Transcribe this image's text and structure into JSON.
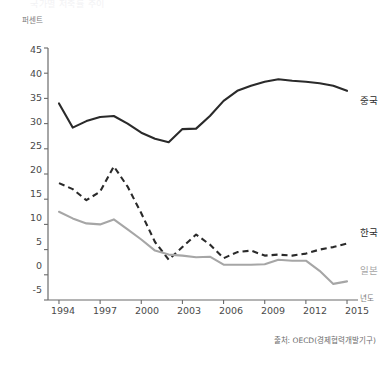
{
  "title": "국가별 저축률 추이",
  "axes": {
    "y_unit": "퍼센트",
    "x_unit": "년도",
    "y_ticks": [
      45,
      40,
      35,
      30,
      25,
      20,
      15,
      10,
      5,
      0,
      -5
    ],
    "x_ticks": [
      1994,
      1997,
      2000,
      2003,
      2006,
      2009,
      2012,
      2015
    ]
  },
  "labels": {
    "china": "중국",
    "korea": "한국",
    "japan": "일본"
  },
  "source": "출처: OECD(경제협력개발기구)",
  "colors": {
    "china": "#2a2a2a",
    "korea": "#2a2a2a",
    "japan": "#a6a6a6",
    "axis": "#6b6b6b"
  },
  "chart_data": {
    "type": "line",
    "title": "국가별 저축률 추이",
    "xlabel": "년도",
    "ylabel": "퍼센트",
    "xlim": [
      1993.2,
      2015.8
    ],
    "ylim": [
      -5,
      45
    ],
    "grid": false,
    "legend_position": "right-inline",
    "x": [
      1994,
      1995,
      1996,
      1997,
      1998,
      1999,
      2000,
      2001,
      2002,
      2003,
      2004,
      2005,
      2006,
      2007,
      2008,
      2009,
      2010,
      2011,
      2012,
      2013,
      2014,
      2015
    ],
    "series": [
      {
        "name": "중국",
        "style": "solid",
        "color": "#2a2a2a",
        "values": [
          34.0,
          29.2,
          30.5,
          31.3,
          31.5,
          30.0,
          28.2,
          27.0,
          26.3,
          28.9,
          29.0,
          31.5,
          34.5,
          36.5,
          37.5,
          38.3,
          38.8,
          38.5,
          38.3,
          38.0,
          37.5,
          36.5
        ]
      },
      {
        "name": "한국",
        "style": "dashed",
        "color": "#2a2a2a",
        "values": [
          18.2,
          17.0,
          14.8,
          16.5,
          21.5,
          17.5,
          12.2,
          6.5,
          3.0,
          5.5,
          8.0,
          6.0,
          3.3,
          4.5,
          4.8,
          3.8,
          4.0,
          3.8,
          4.2,
          5.0,
          5.5,
          6.2
        ]
      },
      {
        "name": "일본",
        "style": "solid",
        "color": "#a6a6a6",
        "values": [
          12.5,
          11.2,
          10.2,
          10.0,
          11.0,
          9.0,
          7.0,
          4.8,
          4.0,
          3.8,
          3.5,
          3.6,
          2.0,
          2.0,
          2.0,
          2.1,
          3.0,
          2.8,
          2.8,
          0.8,
          -1.8,
          -1.3
        ]
      }
    ]
  }
}
